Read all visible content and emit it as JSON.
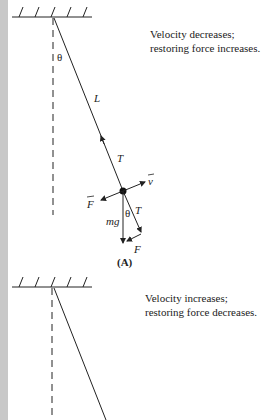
{
  "panel_a": {
    "caption_line1": "Velocity decreases;",
    "caption_line2": "restoring force increases.",
    "label": "(A)",
    "angle_label_top": "θ",
    "length_label": "L",
    "tension_label_string": "T",
    "velocity_label": "v",
    "force_label_left": "F",
    "weight_label": "mg",
    "angle_label_bottom": "θ",
    "tension_label_component": "T",
    "force_label_bottom": "F"
  },
  "panel_b": {
    "caption_line1": "Velocity increases;",
    "caption_line2": "restoring force decreases."
  },
  "colors": {
    "line": "#222222",
    "strip": "#c8c8c8"
  }
}
